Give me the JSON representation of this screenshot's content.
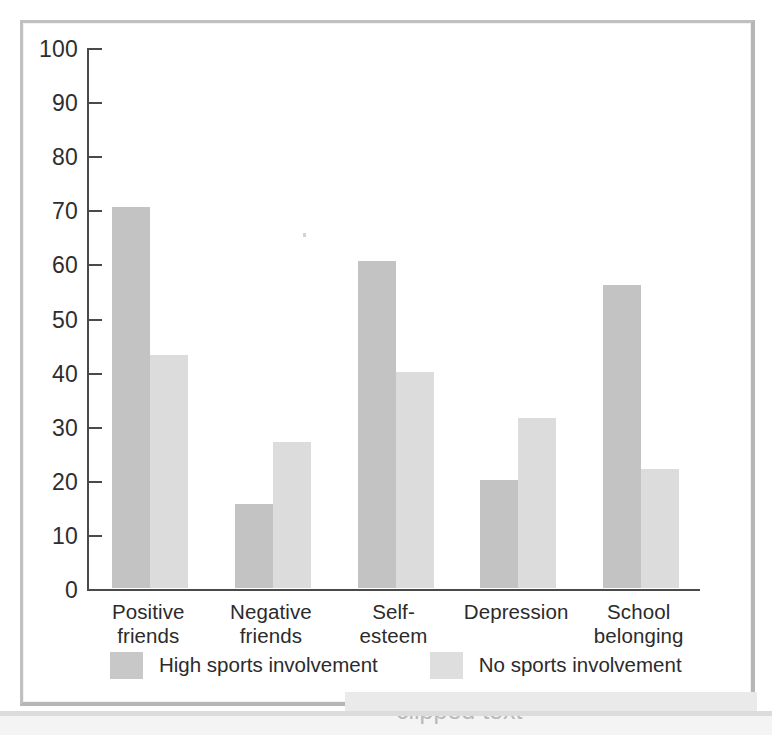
{
  "chart_data": {
    "type": "bar",
    "title": "",
    "subtitle": "",
    "xlabel": "",
    "ylabel": "",
    "ylim": [
      0,
      100
    ],
    "ytick_step": 10,
    "yticks": [
      100,
      90,
      80,
      70,
      60,
      50,
      40,
      30,
      20,
      10,
      0
    ],
    "grid": false,
    "legend_position": "bottom",
    "categories": [
      "Positive\nfriends",
      "Negative\nfriends",
      "Self-\nesteem",
      "Depression",
      "School\nbelonging"
    ],
    "series": [
      {
        "name": "High sports involvement",
        "color": "#c3c3c3",
        "values": [
          70.5,
          15.5,
          60.5,
          20,
          56
        ]
      },
      {
        "name": "No sports involvement",
        "color": "#dcdcdc",
        "values": [
          43,
          27,
          40,
          31.5,
          22
        ]
      }
    ]
  },
  "legend": {
    "entries": [
      {
        "label": "High sports involvement",
        "swatch": "high"
      },
      {
        "label": "No sports involvement",
        "swatch": "none"
      }
    ]
  },
  "artifacts": {
    "clipped_caption_fragment": "clipped text"
  },
  "colors": {
    "series_high": "#c3c3c3",
    "series_none": "#dcdcdc",
    "axis": "#4a4a4a",
    "frame": "#c0c0c0",
    "text": "#2b2b2b"
  }
}
